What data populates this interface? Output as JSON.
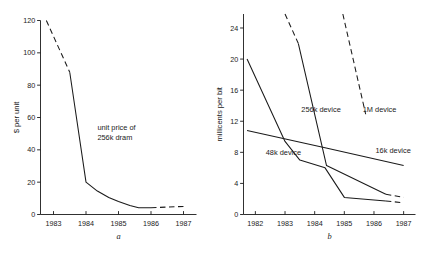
{
  "figure": {
    "background": "#ffffff",
    "ink_color": "#1a1a1a"
  },
  "chart_data": [
    {
      "type": "line",
      "panel": "a",
      "panel_label": "a",
      "title": "",
      "xlabel": "a",
      "ylabel": "$ per unit",
      "xlim": [
        1982.6,
        1987.4
      ],
      "ylim": [
        0,
        120
      ],
      "yticks": [
        0,
        20,
        40,
        60,
        80,
        100,
        120
      ],
      "ytick_labels": [
        "0",
        "20",
        "40",
        "60",
        "80",
        "100",
        "120"
      ],
      "xticks": [
        1983,
        1984,
        1985,
        1986,
        1987
      ],
      "xtick_labels": [
        "1983",
        "1984",
        "1985",
        "1986",
        "1987"
      ],
      "grid": false,
      "legend": "none",
      "annotations": [
        {
          "name": "unit-price-annotation",
          "line1": "unit price of",
          "line2": "256k dram",
          "x": 1984.35,
          "y": 52
        }
      ],
      "series": [
        {
          "name": "unit price of 256k dram",
          "style": "dashed",
          "segment": "forecast-early",
          "x": [
            1982.78,
            1983.5
          ],
          "values": [
            120,
            88
          ]
        },
        {
          "name": "unit price of 256k dram",
          "style": "solid",
          "segment": "actual",
          "x": [
            1983.5,
            1984.0,
            1984.35,
            1984.7,
            1985.0,
            1985.35,
            1985.62,
            1986.0
          ],
          "values": [
            88,
            20,
            14.5,
            10.5,
            8.0,
            5.6,
            4.2,
            4.2
          ]
        },
        {
          "name": "unit price of 256k dram",
          "style": "dashed",
          "segment": "forecast-late",
          "x": [
            1986.0,
            1987.0
          ],
          "values": [
            4.2,
            5.0
          ]
        }
      ]
    },
    {
      "type": "line",
      "panel": "b",
      "panel_label": "b",
      "title": "",
      "xlabel": "b",
      "ylabel": "millicents per bit",
      "xlim": [
        1981.6,
        1987.4
      ],
      "ylim": [
        0,
        25.8
      ],
      "yticks": [
        0,
        4,
        8,
        12,
        16,
        20,
        24
      ],
      "ytick_labels": [
        "0",
        "4",
        "8",
        "12",
        "16",
        "20",
        "24"
      ],
      "xticks": [
        1982,
        1983,
        1984,
        1985,
        1986,
        1987
      ],
      "xtick_labels": [
        "1982",
        "1983",
        "1984",
        "1985",
        "1986",
        "1987"
      ],
      "grid": false,
      "legend": "inline-labels",
      "series": [
        {
          "name": "48k device",
          "label": "48k device",
          "label_x": 1982.35,
          "label_y": 7.6,
          "style": "solid",
          "x": [
            1981.72,
            1983.0,
            1983.5,
            1984.35,
            1985.0,
            1986.4
          ],
          "values": [
            20.0,
            9.4,
            7.0,
            6.0,
            2.2,
            1.75
          ]
        },
        {
          "name": "48k device",
          "label": "",
          "style": "dashed",
          "segment": "forecast",
          "x": [
            1986.4,
            1987.0
          ],
          "values": [
            1.75,
            1.5
          ]
        },
        {
          "name": "16k device",
          "label": "16k device",
          "label_x": 1986.05,
          "label_y": 7.9,
          "style": "solid",
          "x": [
            1981.72,
            1984.35,
            1987.0
          ],
          "values": [
            10.8,
            8.6,
            6.3
          ]
        },
        {
          "name": "256k device",
          "label": "256k device",
          "label_x": 1983.55,
          "label_y": 13.2,
          "style": "dashed",
          "segment": "forecast-early",
          "x": [
            1983.0,
            1983.45
          ],
          "values": [
            25.8,
            22.0
          ]
        },
        {
          "name": "256k device",
          "label": "",
          "style": "solid",
          "segment": "actual",
          "x": [
            1983.45,
            1984.4,
            1986.4
          ],
          "values": [
            22.0,
            6.3,
            2.6
          ]
        },
        {
          "name": "256k device",
          "label": "",
          "style": "dashed",
          "segment": "forecast-late",
          "x": [
            1986.4,
            1987.0
          ],
          "values": [
            2.6,
            2.2
          ]
        },
        {
          "name": "1M device",
          "label": "1M device",
          "label_x": 1985.62,
          "label_y": 13.2,
          "style": "dashed",
          "x": [
            1984.95,
            1985.72
          ],
          "values": [
            25.8,
            12.9
          ]
        }
      ]
    }
  ]
}
